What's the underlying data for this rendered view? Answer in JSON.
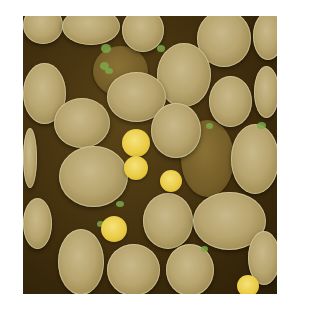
{
  "image": {
    "subject": "Colorized scanning electron micrograph of budding yeast cells",
    "colors": {
      "background": "#ffffff",
      "cell": "#b8a56f",
      "shadow": "#3e2c0c",
      "bud": "#e9cb45",
      "bud_scar": "#7da84a"
    },
    "cells": [
      {
        "x": 0,
        "y": -10,
        "w": 40,
        "h": 38,
        "layer": "front"
      },
      {
        "x": 39,
        "y": -8,
        "w": 58,
        "h": 37,
        "layer": "front"
      },
      {
        "x": 99,
        "y": -8,
        "w": 42,
        "h": 44,
        "layer": "front"
      },
      {
        "x": 174,
        "y": -6,
        "w": 54,
        "h": 57,
        "layer": "front"
      },
      {
        "x": 230,
        "y": -4,
        "w": 30,
        "h": 48,
        "layer": "front"
      },
      {
        "x": 70,
        "y": 30,
        "w": 55,
        "h": 50,
        "layer": "back"
      },
      {
        "x": 134,
        "y": 27,
        "w": 54,
        "h": 64,
        "layer": "front"
      },
      {
        "x": 0,
        "y": 47,
        "w": 43,
        "h": 61,
        "layer": "front"
      },
      {
        "x": 84,
        "y": 56,
        "w": 59,
        "h": 50,
        "layer": "front"
      },
      {
        "x": 186,
        "y": 60,
        "w": 43,
        "h": 51,
        "layer": "front"
      },
      {
        "x": 231,
        "y": 50,
        "w": 25,
        "h": 52,
        "layer": "front"
      },
      {
        "x": 31,
        "y": 82,
        "w": 56,
        "h": 50,
        "layer": "front"
      },
      {
        "x": 128,
        "y": 87,
        "w": 50,
        "h": 55,
        "layer": "front"
      },
      {
        "x": 158,
        "y": 104,
        "w": 53,
        "h": 77,
        "layer": "back"
      },
      {
        "x": 0,
        "y": 112,
        "w": 14,
        "h": 60,
        "layer": "front"
      },
      {
        "x": 208,
        "y": 108,
        "w": 48,
        "h": 70,
        "layer": "front"
      },
      {
        "x": 36,
        "y": 130,
        "w": 69,
        "h": 61,
        "layer": "front"
      },
      {
        "x": 0,
        "y": 182,
        "w": 29,
        "h": 51,
        "layer": "front"
      },
      {
        "x": 120,
        "y": 177,
        "w": 50,
        "h": 56,
        "layer": "front"
      },
      {
        "x": 170,
        "y": 176,
        "w": 73,
        "h": 58,
        "layer": "front"
      },
      {
        "x": 35,
        "y": 213,
        "w": 46,
        "h": 66,
        "layer": "front"
      },
      {
        "x": 84,
        "y": 228,
        "w": 53,
        "h": 52,
        "layer": "front"
      },
      {
        "x": 143,
        "y": 228,
        "w": 48,
        "h": 52,
        "layer": "front"
      },
      {
        "x": 225,
        "y": 215,
        "w": 32,
        "h": 54,
        "layer": "front"
      }
    ],
    "buds": [
      {
        "cx": 113,
        "cy": 127,
        "r": 14
      },
      {
        "cx": 113,
        "cy": 152,
        "r": 12
      },
      {
        "cx": 148,
        "cy": 165,
        "r": 11
      },
      {
        "cx": 91,
        "cy": 213,
        "r": 13
      },
      {
        "cx": 225,
        "cy": 270,
        "r": 11
      }
    ],
    "scars": [
      {
        "x": 78,
        "y": 28,
        "w": 10,
        "h": 9
      },
      {
        "x": 77,
        "y": 46,
        "w": 9,
        "h": 8
      },
      {
        "x": 134,
        "y": 29,
        "w": 8,
        "h": 7
      },
      {
        "x": 82,
        "y": 52,
        "w": 8,
        "h": 6
      },
      {
        "x": 183,
        "y": 107,
        "w": 7,
        "h": 6
      },
      {
        "x": 234,
        "y": 106,
        "w": 9,
        "h": 7
      },
      {
        "x": 93,
        "y": 185,
        "w": 8,
        "h": 6
      },
      {
        "x": 178,
        "y": 230,
        "w": 7,
        "h": 6
      },
      {
        "x": 74,
        "y": 205,
        "w": 7,
        "h": 6
      }
    ]
  }
}
